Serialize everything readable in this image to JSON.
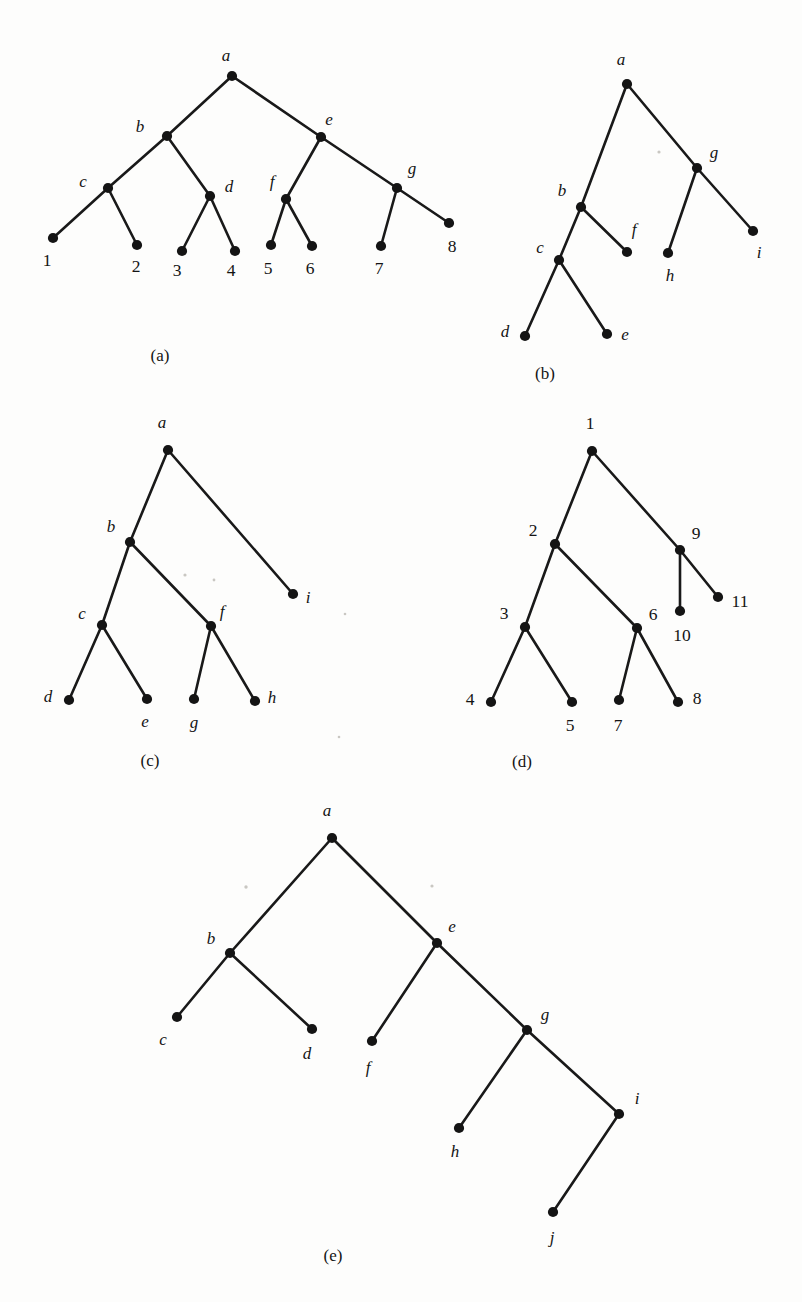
{
  "page": {
    "background_color": "#fdfdfc",
    "ink_color": "#141414",
    "width": 802,
    "height": 1302
  },
  "panels": [
    {
      "id": "a",
      "caption": "(a)",
      "caption_pos": [
        160,
        357
      ],
      "label_style": "mixed",
      "nodes": [
        {
          "id": "a",
          "label": "a",
          "x": 232,
          "y": 76,
          "lx": 226,
          "ly": 57,
          "anchor": "middle",
          "italic": true
        },
        {
          "id": "b",
          "label": "b",
          "x": 167,
          "y": 136,
          "lx": 140,
          "ly": 128,
          "anchor": "middle",
          "italic": true
        },
        {
          "id": "e",
          "label": "e",
          "x": 321,
          "y": 137,
          "lx": 329,
          "ly": 121,
          "anchor": "middle",
          "italic": true
        },
        {
          "id": "c",
          "label": "c",
          "x": 108,
          "y": 188,
          "lx": 83,
          "ly": 183,
          "anchor": "middle",
          "italic": true
        },
        {
          "id": "d",
          "label": "d",
          "x": 210,
          "y": 196,
          "lx": 229,
          "ly": 188,
          "anchor": "middle",
          "italic": true
        },
        {
          "id": "f",
          "label": "f",
          "x": 286,
          "y": 199,
          "lx": 272,
          "ly": 183,
          "anchor": "middle",
          "italic": true
        },
        {
          "id": "g",
          "label": "g",
          "x": 397,
          "y": 188,
          "lx": 412,
          "ly": 170,
          "anchor": "middle",
          "italic": true
        },
        {
          "id": "n1",
          "label": "1",
          "x": 53,
          "y": 238,
          "lx": 47,
          "ly": 262,
          "anchor": "middle",
          "italic": false
        },
        {
          "id": "n2",
          "label": "2",
          "x": 137,
          "y": 245,
          "lx": 136,
          "ly": 268,
          "anchor": "middle",
          "italic": false
        },
        {
          "id": "n3",
          "label": "3",
          "x": 182,
          "y": 251,
          "lx": 177,
          "ly": 272,
          "anchor": "middle",
          "italic": false
        },
        {
          "id": "n4",
          "label": "4",
          "x": 235,
          "y": 251,
          "lx": 231,
          "ly": 272,
          "anchor": "middle",
          "italic": false
        },
        {
          "id": "n5",
          "label": "5",
          "x": 271,
          "y": 245,
          "lx": 268,
          "ly": 270,
          "anchor": "middle",
          "italic": false
        },
        {
          "id": "n6",
          "label": "6",
          "x": 312,
          "y": 246,
          "lx": 310,
          "ly": 270,
          "anchor": "middle",
          "italic": false
        },
        {
          "id": "n7",
          "label": "7",
          "x": 381,
          "y": 246,
          "lx": 379,
          "ly": 270,
          "anchor": "middle",
          "italic": false
        },
        {
          "id": "n8",
          "label": "8",
          "x": 449,
          "y": 223,
          "lx": 452,
          "ly": 248,
          "anchor": "middle",
          "italic": false
        }
      ],
      "edges": [
        [
          "a",
          "b"
        ],
        [
          "a",
          "e"
        ],
        [
          "b",
          "c"
        ],
        [
          "b",
          "d"
        ],
        [
          "c",
          "n1"
        ],
        [
          "c",
          "n2"
        ],
        [
          "d",
          "n3"
        ],
        [
          "d",
          "n4"
        ],
        [
          "e",
          "f"
        ],
        [
          "e",
          "g"
        ],
        [
          "f",
          "n5"
        ],
        [
          "f",
          "n6"
        ],
        [
          "g",
          "n7"
        ],
        [
          "g",
          "n8"
        ]
      ]
    },
    {
      "id": "b",
      "caption": "(b)",
      "caption_pos": [
        545,
        375
      ],
      "label_style": "alpha",
      "nodes": [
        {
          "id": "a",
          "label": "a",
          "x": 627,
          "y": 84,
          "lx": 621,
          "ly": 61,
          "anchor": "middle",
          "italic": true
        },
        {
          "id": "g",
          "label": "g",
          "x": 697,
          "y": 168,
          "lx": 714,
          "ly": 154,
          "anchor": "middle",
          "italic": true
        },
        {
          "id": "b",
          "label": "b",
          "x": 581,
          "y": 207,
          "lx": 562,
          "ly": 192,
          "anchor": "middle",
          "italic": true
        },
        {
          "id": "c",
          "label": "c",
          "x": 559,
          "y": 260,
          "lx": 540,
          "ly": 249,
          "anchor": "middle",
          "italic": true
        },
        {
          "id": "f",
          "label": "f",
          "x": 627,
          "y": 252,
          "lx": 634,
          "ly": 231,
          "anchor": "middle",
          "italic": true
        },
        {
          "id": "h",
          "label": "h",
          "x": 668,
          "y": 253,
          "lx": 670,
          "ly": 277,
          "anchor": "middle",
          "italic": true
        },
        {
          "id": "i",
          "label": "i",
          "x": 753,
          "y": 231,
          "lx": 759,
          "ly": 254,
          "anchor": "middle",
          "italic": true
        },
        {
          "id": "d",
          "label": "d",
          "x": 525,
          "y": 336,
          "lx": 505,
          "ly": 333,
          "anchor": "middle",
          "italic": true
        },
        {
          "id": "e",
          "label": "e",
          "x": 607,
          "y": 334,
          "lx": 625,
          "ly": 336,
          "anchor": "middle",
          "italic": true
        }
      ],
      "edges": [
        [
          "a",
          "b"
        ],
        [
          "a",
          "g"
        ],
        [
          "b",
          "c"
        ],
        [
          "b",
          "f"
        ],
        [
          "c",
          "d"
        ],
        [
          "c",
          "e"
        ],
        [
          "g",
          "h"
        ],
        [
          "g",
          "i"
        ]
      ]
    },
    {
      "id": "c",
      "caption": "(c)",
      "caption_pos": [
        150,
        762
      ],
      "label_style": "alpha",
      "nodes": [
        {
          "id": "a",
          "label": "a",
          "x": 168,
          "y": 450,
          "lx": 162,
          "ly": 424,
          "anchor": "middle",
          "italic": true
        },
        {
          "id": "b",
          "label": "b",
          "x": 130,
          "y": 542,
          "lx": 111,
          "ly": 528,
          "anchor": "middle",
          "italic": true
        },
        {
          "id": "c",
          "label": "c",
          "x": 102,
          "y": 625,
          "lx": 82,
          "ly": 615,
          "anchor": "middle",
          "italic": true
        },
        {
          "id": "f",
          "label": "f",
          "x": 211,
          "y": 626,
          "lx": 222,
          "ly": 613,
          "anchor": "middle",
          "italic": true
        },
        {
          "id": "i",
          "label": "i",
          "x": 293,
          "y": 594,
          "lx": 308,
          "ly": 599,
          "anchor": "middle",
          "italic": true
        },
        {
          "id": "d",
          "label": "d",
          "x": 69,
          "y": 700,
          "lx": 48,
          "ly": 698,
          "anchor": "middle",
          "italic": true
        },
        {
          "id": "e",
          "label": "e",
          "x": 147,
          "y": 699,
          "lx": 145,
          "ly": 723,
          "anchor": "middle",
          "italic": true
        },
        {
          "id": "g",
          "label": "g",
          "x": 194,
          "y": 699,
          "lx": 194,
          "ly": 724,
          "anchor": "middle",
          "italic": true
        },
        {
          "id": "h",
          "label": "h",
          "x": 255,
          "y": 701,
          "lx": 272,
          "ly": 699,
          "anchor": "middle",
          "italic": true
        }
      ],
      "edges": [
        [
          "a",
          "b"
        ],
        [
          "a",
          "i"
        ],
        [
          "b",
          "c"
        ],
        [
          "b",
          "f"
        ],
        [
          "c",
          "d"
        ],
        [
          "c",
          "e"
        ],
        [
          "f",
          "g"
        ],
        [
          "f",
          "h"
        ]
      ]
    },
    {
      "id": "d",
      "caption": "(d)",
      "caption_pos": [
        522,
        763
      ],
      "label_style": "numeric",
      "nodes": [
        {
          "id": "n1",
          "label": "1",
          "x": 592,
          "y": 451,
          "lx": 590,
          "ly": 425,
          "anchor": "middle",
          "italic": false
        },
        {
          "id": "n2",
          "label": "2",
          "x": 555,
          "y": 544,
          "lx": 533,
          "ly": 532,
          "anchor": "middle",
          "italic": false
        },
        {
          "id": "n9",
          "label": "9",
          "x": 680,
          "y": 550,
          "lx": 696,
          "ly": 535,
          "anchor": "middle",
          "italic": false
        },
        {
          "id": "n3",
          "label": "3",
          "x": 525,
          "y": 627,
          "lx": 504,
          "ly": 615,
          "anchor": "middle",
          "italic": false
        },
        {
          "id": "n6",
          "label": "6",
          "x": 637,
          "y": 628,
          "lx": 653,
          "ly": 616,
          "anchor": "middle",
          "italic": false
        },
        {
          "id": "n10",
          "label": "10",
          "x": 680,
          "y": 611,
          "lx": 682,
          "ly": 637,
          "anchor": "middle",
          "italic": false
        },
        {
          "id": "n11",
          "label": "11",
          "x": 718,
          "y": 597,
          "lx": 740,
          "ly": 603,
          "anchor": "middle",
          "italic": false
        },
        {
          "id": "n4",
          "label": "4",
          "x": 491,
          "y": 702,
          "lx": 470,
          "ly": 701,
          "anchor": "middle",
          "italic": false
        },
        {
          "id": "n5",
          "label": "5",
          "x": 572,
          "y": 702,
          "lx": 570,
          "ly": 727,
          "anchor": "middle",
          "italic": false
        },
        {
          "id": "n7",
          "label": "7",
          "x": 619,
          "y": 700,
          "lx": 618,
          "ly": 727,
          "anchor": "middle",
          "italic": false
        },
        {
          "id": "n8",
          "label": "8",
          "x": 678,
          "y": 702,
          "lx": 697,
          "ly": 700,
          "anchor": "middle",
          "italic": false
        }
      ],
      "edges": [
        [
          "n1",
          "n2"
        ],
        [
          "n1",
          "n9"
        ],
        [
          "n2",
          "n3"
        ],
        [
          "n2",
          "n6"
        ],
        [
          "n3",
          "n4"
        ],
        [
          "n3",
          "n5"
        ],
        [
          "n6",
          "n7"
        ],
        [
          "n6",
          "n8"
        ],
        [
          "n9",
          "n10"
        ],
        [
          "n9",
          "n11"
        ]
      ]
    },
    {
      "id": "e",
      "caption": "(e)",
      "caption_pos": [
        333,
        1257
      ],
      "label_style": "alpha",
      "nodes": [
        {
          "id": "a",
          "label": "a",
          "x": 332,
          "y": 838,
          "lx": 327,
          "ly": 812,
          "anchor": "middle",
          "italic": true
        },
        {
          "id": "b",
          "label": "b",
          "x": 230,
          "y": 953,
          "lx": 211,
          "ly": 940,
          "anchor": "middle",
          "italic": true
        },
        {
          "id": "e",
          "label": "e",
          "x": 437,
          "y": 943,
          "lx": 452,
          "ly": 928,
          "anchor": "middle",
          "italic": true
        },
        {
          "id": "c",
          "label": "c",
          "x": 177,
          "y": 1017,
          "lx": 163,
          "ly": 1041,
          "anchor": "middle",
          "italic": true
        },
        {
          "id": "d",
          "label": "d",
          "x": 312,
          "y": 1029,
          "lx": 307,
          "ly": 1055,
          "anchor": "middle",
          "italic": true
        },
        {
          "id": "f",
          "label": "f",
          "x": 372,
          "y": 1041,
          "lx": 368,
          "ly": 1069,
          "anchor": "middle",
          "italic": true
        },
        {
          "id": "g",
          "label": "g",
          "x": 527,
          "y": 1030,
          "lx": 545,
          "ly": 1016,
          "anchor": "middle",
          "italic": true
        },
        {
          "id": "h",
          "label": "h",
          "x": 459,
          "y": 1128,
          "lx": 455,
          "ly": 1153,
          "anchor": "middle",
          "italic": true
        },
        {
          "id": "i",
          "label": "i",
          "x": 619,
          "y": 1114,
          "lx": 637,
          "ly": 1100,
          "anchor": "middle",
          "italic": true
        },
        {
          "id": "j",
          "label": "j",
          "x": 553,
          "y": 1212,
          "lx": 552,
          "ly": 1239,
          "anchor": "middle",
          "italic": true
        }
      ],
      "edges": [
        [
          "a",
          "b"
        ],
        [
          "a",
          "e"
        ],
        [
          "b",
          "c"
        ],
        [
          "b",
          "d"
        ],
        [
          "e",
          "f"
        ],
        [
          "e",
          "g"
        ],
        [
          "g",
          "h"
        ],
        [
          "g",
          "i"
        ],
        [
          "i",
          "j"
        ]
      ]
    }
  ],
  "specks": [
    {
      "x": 659,
      "y": 152,
      "r": 1.6
    },
    {
      "x": 185,
      "y": 575,
      "r": 1.6
    },
    {
      "x": 214,
      "y": 580,
      "r": 1.4
    },
    {
      "x": 246,
      "y": 887,
      "r": 1.7
    },
    {
      "x": 432,
      "y": 886,
      "r": 1.6
    },
    {
      "x": 339,
      "y": 737,
      "r": 1.3
    },
    {
      "x": 345,
      "y": 614,
      "r": 1.3
    }
  ]
}
